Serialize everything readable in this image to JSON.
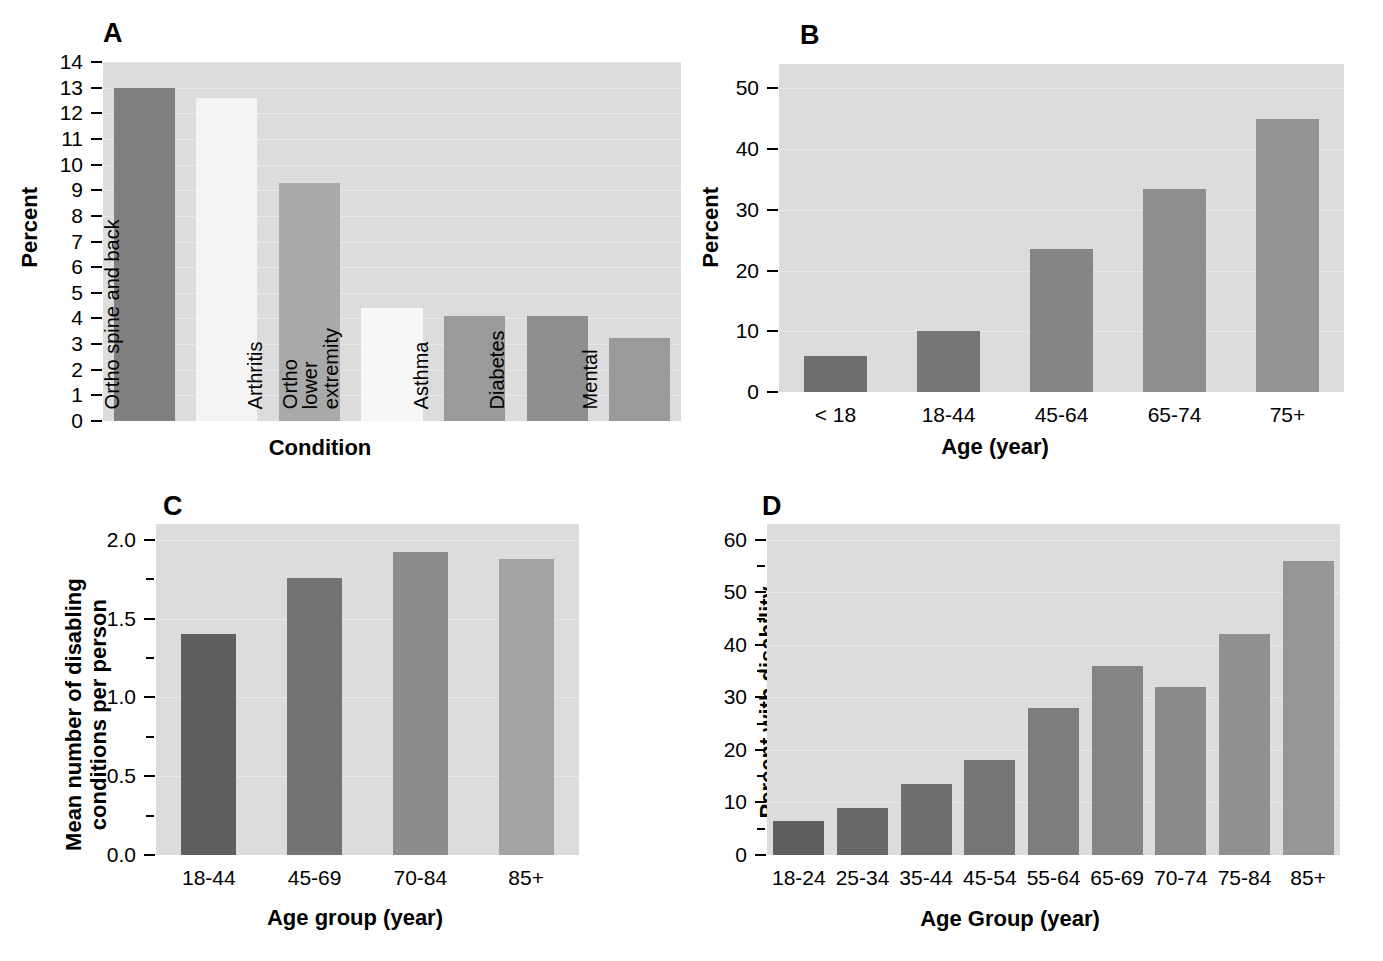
{
  "figure": {
    "panels": [
      "A",
      "B",
      "C",
      "D"
    ]
  },
  "chart_data": [
    {
      "panel": "A",
      "type": "bar",
      "title": "A",
      "xlabel": "Condition",
      "ylabel": "Percent",
      "ylim": [
        0,
        14
      ],
      "yticks": [
        0,
        1,
        2,
        3,
        4,
        5,
        6,
        7,
        8,
        9,
        10,
        11,
        12,
        13,
        14
      ],
      "grid": true,
      "categories": [
        "Heart disease",
        "Ortho spine and back",
        "Arthritis",
        "Ortho lower extremity",
        "Asthma",
        "Diabetes",
        "Mental"
      ],
      "values": [
        13.0,
        12.6,
        9.3,
        4.4,
        4.1,
        4.1,
        3.25
      ],
      "bar_colors": [
        "#808080",
        "#f4f4f4",
        "#a9a9a9",
        "#f7f7f7",
        "#9a9a9a",
        "#8e8e8e",
        "#9a9a9a"
      ],
      "label_inside_bars": true
    },
    {
      "panel": "B",
      "type": "bar",
      "title": "B",
      "xlabel": "Age (year)",
      "ylabel": "Percent",
      "ylim": [
        0,
        54
      ],
      "yticks": [
        0,
        10,
        20,
        30,
        40,
        50
      ],
      "grid": true,
      "categories": [
        "< 18",
        "18-44",
        "45-64",
        "65-74",
        "75+"
      ],
      "values": [
        6,
        10,
        23.5,
        33.5,
        45
      ],
      "bar_colors": [
        "#6e6e6e",
        "#767676",
        "#858585",
        "#8d8d8d",
        "#949494"
      ]
    },
    {
      "panel": "C",
      "type": "bar",
      "title": "C",
      "xlabel": "Age group (year)",
      "ylabel": "Mean number of disabling\nconditions per person",
      "ylim": [
        0.0,
        2.1
      ],
      "yticks": [
        0.0,
        0.5,
        1.0,
        1.5,
        2.0
      ],
      "yticks_minor": [
        0.25,
        0.75,
        1.25,
        1.75
      ],
      "grid": true,
      "categories": [
        "18-44",
        "45-69",
        "70-84",
        "85+"
      ],
      "values": [
        1.4,
        1.76,
        1.92,
        1.88
      ],
      "bar_colors": [
        "#5f5f5f",
        "#737373",
        "#8c8c8c",
        "#a3a3a3"
      ]
    },
    {
      "panel": "D",
      "type": "bar",
      "title": "D",
      "xlabel": "Age Group (year)",
      "ylabel": "Percent with disability",
      "ylim": [
        0,
        63
      ],
      "yticks": [
        0,
        10,
        20,
        30,
        40,
        50,
        60
      ],
      "yticks_minor": [
        5,
        15,
        25,
        35,
        45,
        55
      ],
      "grid": true,
      "categories": [
        "18-24",
        "25-34",
        "35-44",
        "45-54",
        "55-64",
        "65-69",
        "70-74",
        "75-84",
        "85+"
      ],
      "values": [
        6.5,
        9.0,
        13.5,
        18.0,
        28.0,
        36.0,
        32.0,
        42.0,
        56.0
      ],
      "bar_colors": [
        "#5e5e5e",
        "#686868",
        "#6f6f6f",
        "#767676",
        "#7d7d7d",
        "#848484",
        "#8a8a8a",
        "#909090",
        "#969696"
      ]
    }
  ]
}
